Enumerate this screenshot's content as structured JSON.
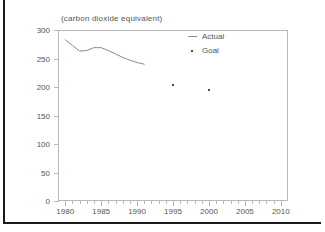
{
  "chart_data": {
    "type": "line",
    "title": "(carbon dioxide equivalent)",
    "xlabel": "",
    "ylabel": "",
    "xlim": [
      1979,
      2011
    ],
    "ylim": [
      0,
      300
    ],
    "ytick_values": [
      0,
      50,
      100,
      150,
      200,
      250,
      300
    ],
    "ytick_labels": [
      "0",
      "50",
      "100",
      "150",
      "200",
      "250",
      "300"
    ],
    "xtick_values": [
      1980,
      1985,
      1990,
      1995,
      2000,
      2005,
      2010
    ],
    "xtick_labels": [
      "1980",
      "1985",
      "1990",
      "1995",
      "2000",
      "2005",
      "2010"
    ],
    "xtick_minor_step": 1,
    "grid": false,
    "legend_position": "upper-right-inside",
    "series": [
      {
        "name": "Actual",
        "marker": "line",
        "color": "#8a8a8a",
        "x": [
          1980,
          1981,
          1982,
          1983,
          1984,
          1985,
          1986,
          1987,
          1988,
          1989,
          1990,
          1991
        ],
        "values": [
          283,
          273,
          263,
          264,
          269,
          269,
          264,
          258,
          252,
          247,
          243,
          240
        ]
      },
      {
        "name": "Goal",
        "marker": "dot",
        "color": "#4a4a4a",
        "x": [
          1995,
          2000
        ],
        "values": [
          204,
          195
        ]
      }
    ]
  },
  "legend": {
    "entries": [
      {
        "label": "Actual",
        "marker": "line"
      },
      {
        "label": "Goal",
        "marker": "dot"
      }
    ]
  },
  "colors": {
    "actual_line": "#8a8a8a",
    "goal_dot": "#4a4a4a",
    "axis": "#b9b9b9",
    "frame": "#1a1a1a",
    "text": "#555555",
    "background": "#ffffff"
  }
}
